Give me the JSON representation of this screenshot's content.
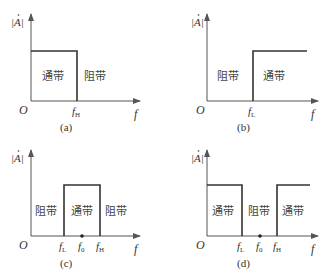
{
  "figure": {
    "y_axis_label": "|A|",
    "origin_label": "O",
    "x_axis_label": "f",
    "colors": {
      "axis": "#555555",
      "response": "#333333",
      "text": "#333333"
    }
  },
  "panels": [
    {
      "caption": "(a)",
      "type": "low-pass",
      "bands": [
        {
          "label": "通带",
          "role": "passband"
        },
        {
          "label": "阻带",
          "role": "stopband"
        }
      ],
      "ticks": [
        {
          "main": "f",
          "sub": "H"
        }
      ]
    },
    {
      "caption": "(b)",
      "type": "high-pass",
      "bands": [
        {
          "label": "阻带",
          "role": "stopband"
        },
        {
          "label": "通带",
          "role": "passband"
        }
      ],
      "ticks": [
        {
          "main": "f",
          "sub": "L"
        }
      ]
    },
    {
      "caption": "(c)",
      "type": "band-pass",
      "bands": [
        {
          "label": "阻带",
          "role": "stopband"
        },
        {
          "label": "通带",
          "role": "passband"
        },
        {
          "label": "阻带",
          "role": "stopband"
        }
      ],
      "ticks": [
        {
          "main": "f",
          "sub": "L"
        },
        {
          "main": "f",
          "sub": "0"
        },
        {
          "main": "f",
          "sub": "H"
        }
      ]
    },
    {
      "caption": "(d)",
      "type": "band-stop",
      "bands": [
        {
          "label": "通带",
          "role": "passband"
        },
        {
          "label": "阻带",
          "role": "stopband"
        },
        {
          "label": "通带",
          "role": "passband"
        }
      ],
      "ticks": [
        {
          "main": "f",
          "sub": "L"
        },
        {
          "main": "f",
          "sub": "0"
        },
        {
          "main": "f",
          "sub": "H"
        }
      ]
    }
  ]
}
